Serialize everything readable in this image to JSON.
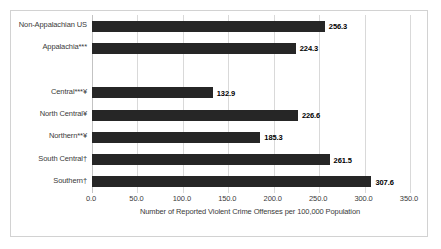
{
  "chart_data": {
    "type": "bar",
    "orientation": "horizontal",
    "title": "",
    "xlabel": "Number of Reported Violent Crime Offenses per 100,000 Population",
    "ylabel": "",
    "xlim": [
      0,
      350
    ],
    "xticks": [
      "0.0",
      "50.0",
      "100.0",
      "150.0",
      "200.0",
      "250.0",
      "300.0",
      "350.0"
    ],
    "xtick_values": [
      0,
      50,
      100,
      150,
      200,
      250,
      300,
      350
    ],
    "grid": true,
    "legend": false,
    "bar_color": "#262626",
    "categories": [
      "Non-Appalachian US",
      "Appalachia***",
      "",
      "Central***¥",
      "North Central¥",
      "Northern**¥",
      "South Central†",
      "Southern†"
    ],
    "values": [
      256.3,
      224.3,
      null,
      132.9,
      226.6,
      185.3,
      261.5,
      307.6
    ],
    "value_labels": [
      "256.3",
      "224.3",
      "",
      "132.9",
      "226.6",
      "185.3",
      "261.5",
      "307.6"
    ]
  }
}
